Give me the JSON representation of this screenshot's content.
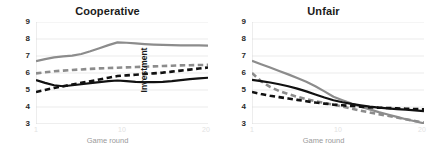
{
  "figure": {
    "panels": [
      {
        "title": "Cooperative",
        "ylabel": "Investment",
        "xlabel": "Game round",
        "yticks": [
          "3",
          "4",
          "5",
          "6",
          "7",
          "8",
          "9"
        ],
        "xticks": [
          "1",
          "10",
          "20"
        ]
      },
      {
        "title": "Unfair",
        "ylabel": "Investment",
        "xlabel": "Game round",
        "yticks": [
          "3",
          "4",
          "5",
          "6",
          "7",
          "8",
          "9"
        ],
        "xticks": [
          "1",
          "10",
          "20"
        ]
      }
    ],
    "colors": {
      "gray": "#8c8c8c",
      "black": "#111111",
      "grid": "#e6e6e6",
      "axis": "#d8d8d8",
      "title": "#1b1b1b"
    }
  },
  "chart_data": [
    {
      "type": "line",
      "title": "Cooperative",
      "xlabel": "Game round",
      "ylabel": "Investment",
      "xlim": [
        1,
        20
      ],
      "ylim": [
        3,
        9
      ],
      "xticks": [
        1,
        10,
        20
      ],
      "yticks": [
        3,
        4,
        5,
        6,
        7,
        8,
        9
      ],
      "grid": true,
      "legend": "none",
      "x": [
        1,
        2,
        3,
        4,
        5,
        6,
        7,
        8,
        9,
        10,
        11,
        12,
        13,
        14,
        15,
        16,
        17,
        18,
        19,
        20
      ],
      "series": [
        {
          "name": "gray-solid",
          "style": "solid",
          "color": "#8c8c8c",
          "values": [
            6.7,
            6.82,
            6.92,
            6.98,
            7.02,
            7.12,
            7.28,
            7.46,
            7.64,
            7.8,
            7.78,
            7.74,
            7.7,
            7.67,
            7.65,
            7.64,
            7.63,
            7.62,
            7.62,
            7.61
          ]
        },
        {
          "name": "gray-dashed",
          "style": "dashed",
          "color": "#8c8c8c",
          "values": [
            5.98,
            6.04,
            6.1,
            6.14,
            6.18,
            6.21,
            6.24,
            6.27,
            6.29,
            6.31,
            6.33,
            6.35,
            6.37,
            6.39,
            6.41,
            6.43,
            6.45,
            6.46,
            6.47,
            6.48
          ]
        },
        {
          "name": "black-dashed",
          "style": "dashed",
          "color": "#111111",
          "values": [
            4.88,
            5.0,
            5.12,
            5.22,
            5.32,
            5.42,
            5.52,
            5.62,
            5.72,
            5.82,
            5.86,
            5.9,
            5.94,
            5.98,
            6.02,
            6.08,
            6.14,
            6.2,
            6.26,
            6.32
          ]
        },
        {
          "name": "black-solid",
          "style": "solid",
          "color": "#111111",
          "values": [
            5.58,
            5.42,
            5.28,
            5.22,
            5.28,
            5.34,
            5.4,
            5.46,
            5.52,
            5.56,
            5.52,
            5.48,
            5.46,
            5.46,
            5.48,
            5.52,
            5.58,
            5.64,
            5.68,
            5.72
          ]
        }
      ]
    },
    {
      "type": "line",
      "title": "Unfair",
      "xlabel": "Game round",
      "ylabel": "Investment",
      "xlim": [
        1,
        20
      ],
      "ylim": [
        3,
        9
      ],
      "xticks": [
        1,
        10,
        20
      ],
      "yticks": [
        3,
        4,
        5,
        6,
        7,
        8,
        9
      ],
      "grid": true,
      "legend": "none",
      "x": [
        1,
        2,
        3,
        4,
        5,
        6,
        7,
        8,
        9,
        10,
        11,
        12,
        13,
        14,
        15,
        16,
        17,
        18,
        19,
        20
      ],
      "series": [
        {
          "name": "gray-solid",
          "style": "solid",
          "color": "#8c8c8c",
          "values": [
            6.72,
            6.52,
            6.32,
            6.12,
            5.92,
            5.7,
            5.48,
            5.22,
            4.92,
            4.6,
            4.4,
            4.2,
            4.02,
            3.86,
            3.7,
            3.56,
            3.42,
            3.28,
            3.16,
            3.04
          ]
        },
        {
          "name": "gray-dashed",
          "style": "dashed",
          "color": "#8c8c8c",
          "values": [
            6.0,
            5.52,
            5.18,
            4.94,
            4.76,
            4.6,
            4.46,
            4.34,
            4.24,
            4.14,
            4.02,
            3.9,
            3.78,
            3.68,
            3.58,
            3.48,
            3.38,
            3.28,
            3.18,
            3.08
          ]
        },
        {
          "name": "black-dashed",
          "style": "dashed",
          "color": "#111111",
          "values": [
            4.88,
            4.76,
            4.66,
            4.58,
            4.5,
            4.42,
            4.34,
            4.26,
            4.2,
            4.14,
            4.1,
            4.06,
            4.02,
            3.98,
            3.96,
            3.94,
            3.92,
            3.9,
            3.88,
            3.86
          ]
        },
        {
          "name": "black-solid",
          "style": "solid",
          "color": "#111111",
          "values": [
            5.6,
            5.52,
            5.44,
            5.34,
            5.22,
            5.08,
            4.92,
            4.74,
            4.56,
            4.4,
            4.28,
            4.18,
            4.1,
            4.02,
            3.96,
            3.92,
            3.88,
            3.84,
            3.8,
            3.76
          ]
        }
      ]
    }
  ]
}
